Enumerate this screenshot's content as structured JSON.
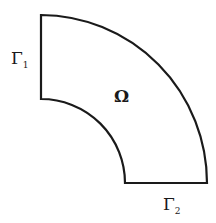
{
  "diagram": {
    "type": "annular-sector domain",
    "region_label": "Ω",
    "boundaries": [
      {
        "symbol": "Γ",
        "subscript": "1",
        "position": "left edge"
      },
      {
        "symbol": "Γ",
        "subscript": "2",
        "position": "bottom edge"
      }
    ],
    "stroke_color": "#1a1a1a",
    "background": "#ffffff"
  }
}
